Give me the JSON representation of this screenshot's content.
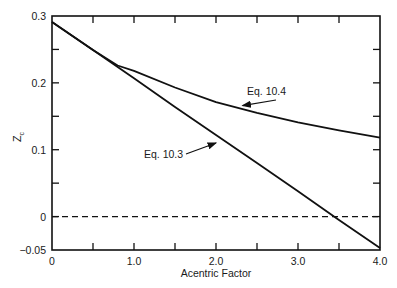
{
  "chart_data": {
    "type": "line",
    "title": "",
    "xlabel": "Acentric Factor",
    "ylabel": "Zc",
    "xlim": [
      0,
      4.0
    ],
    "ylim": [
      -0.05,
      0.3
    ],
    "x_ticks": [
      0,
      0.5,
      1.0,
      1.5,
      2.0,
      2.5,
      3.0,
      3.5,
      4.0
    ],
    "x_tick_labels": [
      "0",
      "",
      "1.0",
      "",
      "2.0",
      "",
      "3.0",
      "",
      "4.0"
    ],
    "y_ticks": [
      -0.05,
      0,
      0.05,
      0.1,
      0.15,
      0.2,
      0.25,
      0.3
    ],
    "y_tick_labels": [
      "-0.05",
      "0",
      "",
      "0.1",
      "",
      "0.2",
      "",
      "0.3"
    ],
    "grid": false,
    "legend": "none (inline annotations with arrows)",
    "series": [
      {
        "name": "Eq. 10.3",
        "style": "solid",
        "x": [
          0,
          0.5,
          1.0,
          1.5,
          2.0,
          2.5,
          3.0,
          3.5,
          4.0
        ],
        "values": [
          0.291,
          0.249,
          0.207,
          0.164,
          0.122,
          0.08,
          0.038,
          -0.005,
          -0.047
        ]
      },
      {
        "name": "Eq. 10.4",
        "style": "solid",
        "x": [
          0,
          0.5,
          0.8,
          1.0,
          1.5,
          2.0,
          2.5,
          3.0,
          3.5,
          4.0
        ],
        "values": [
          0.291,
          0.249,
          0.226,
          0.218,
          0.193,
          0.171,
          0.155,
          0.141,
          0.129,
          0.118
        ]
      },
      {
        "name": "Zc = 0 reference",
        "style": "dashed",
        "x": [
          0,
          4.0
        ],
        "values": [
          0,
          0
        ]
      }
    ],
    "annotations": [
      {
        "text": "Eq. 10.4",
        "points_to": [
          2.3,
          0.163
        ]
      },
      {
        "text": "Eq. 10.3",
        "points_to": [
          1.4,
          0.17
        ]
      }
    ]
  }
}
